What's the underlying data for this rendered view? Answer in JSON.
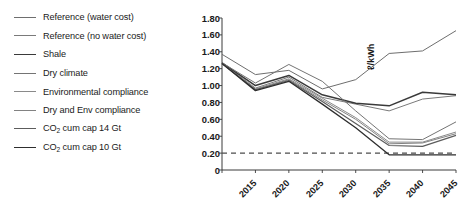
{
  "chart_data": {
    "type": "line",
    "title": "",
    "xlabel": "",
    "ylabel": "ℓ/kWh",
    "x": [
      2015,
      2020,
      2025,
      2030,
      2035,
      2040,
      2045,
      2050
    ],
    "xtick_labels": [
      "2015",
      "2020",
      "2025",
      "2030",
      "2035",
      "2040",
      "2045",
      "2050"
    ],
    "xlim": [
      2015,
      2050
    ],
    "ylim": [
      0,
      1.8
    ],
    "ytick_labels": [
      "0",
      "0.20",
      "0.40",
      "0.60",
      "0.80",
      "1.00",
      "1.20",
      "1.40",
      "1.60",
      "1.80"
    ],
    "ytick_values": [
      0,
      0.2,
      0.4,
      0.6,
      0.8,
      1.0,
      1.2,
      1.4,
      1.6,
      1.8
    ],
    "grid": false,
    "legend_position": "left-outside",
    "reference_line": {
      "label": "",
      "value": 0.2,
      "style": "dashed",
      "color": "#4d4d4d"
    },
    "series": [
      {
        "name": "Reference (water cost)",
        "color": "#6e6e6e",
        "width": 1.0,
        "values": [
          1.37,
          1.13,
          1.18,
          0.96,
          1.07,
          1.38,
          1.41,
          1.65
        ]
      },
      {
        "name": "Reference (no water cost)",
        "color": "#7a7a7a",
        "width": 1.0,
        "values": [
          1.27,
          0.97,
          1.1,
          0.86,
          0.78,
          0.7,
          0.84,
          0.88
        ]
      },
      {
        "name": "Shale",
        "color": "#3a3a3a",
        "width": 1.5,
        "values": [
          1.27,
          1.0,
          1.12,
          0.89,
          0.79,
          0.76,
          0.92,
          0.89
        ]
      },
      {
        "name": "Dry climate",
        "color": "#747474",
        "width": 1.0,
        "values": [
          1.27,
          1.03,
          1.25,
          1.05,
          0.7,
          0.37,
          0.36,
          0.57
        ]
      },
      {
        "name": "Environmental compliance",
        "color": "#8a8a8a",
        "width": 1.0,
        "values": [
          1.26,
          0.96,
          1.08,
          0.85,
          0.62,
          0.33,
          0.33,
          0.45
        ]
      },
      {
        "name": "Dry and Env compliance",
        "color": "#828282",
        "width": 1.0,
        "values": [
          1.26,
          0.95,
          1.07,
          0.83,
          0.6,
          0.31,
          0.32,
          0.43
        ]
      },
      {
        "name": "CO2 cum cap 14 Gt",
        "color": "#5c5c5c",
        "width": 1.2,
        "values": [
          1.26,
          0.95,
          1.06,
          0.81,
          0.55,
          0.29,
          0.28,
          0.41
        ]
      },
      {
        "name": "CO2 cum cap 10 Gt",
        "color": "#2e2e2e",
        "width": 1.3,
        "values": [
          1.26,
          0.94,
          1.05,
          0.78,
          0.5,
          0.18,
          0.18,
          0.18
        ]
      }
    ]
  },
  "legend": {
    "items": [
      {
        "label_prefix": "Reference (water cost)",
        "sub": "",
        "label_suffix": ""
      },
      {
        "label_prefix": "Reference (no water cost)",
        "sub": "",
        "label_suffix": ""
      },
      {
        "label_prefix": "Shale",
        "sub": "",
        "label_suffix": ""
      },
      {
        "label_prefix": "Dry climate",
        "sub": "",
        "label_suffix": ""
      },
      {
        "label_prefix": "Environmental compliance",
        "sub": "",
        "label_suffix": ""
      },
      {
        "label_prefix": "Dry and Env compliance",
        "sub": "",
        "label_suffix": ""
      },
      {
        "label_prefix": "CO",
        "sub": "2",
        "label_suffix": " cum cap 14 Gt"
      },
      {
        "label_prefix": "CO",
        "sub": "2",
        "label_suffix": " cum cap 10 Gt"
      }
    ]
  }
}
